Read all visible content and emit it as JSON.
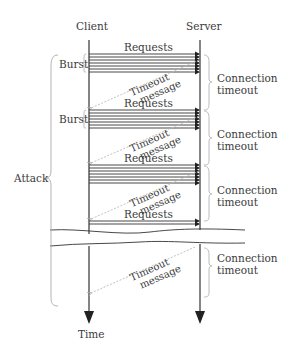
{
  "diagram": {
    "actors": {
      "client": "Client",
      "server": "Server"
    },
    "axis_label": "Time",
    "requests_label": "Requests",
    "burst_label": "Burst",
    "attack_label": "Attack",
    "timeout_message": [
      "Timeout",
      "message"
    ],
    "connection_timeout": [
      "Connection",
      "timeout"
    ],
    "phases": [
      {
        "requests": "Requests",
        "burst": "Burst",
        "timeout": "Connection timeout",
        "message": "Timeout message"
      },
      {
        "requests": "Requests",
        "burst": "Burst",
        "timeout": "Connection timeout",
        "message": "Timeout message"
      },
      {
        "requests": "Requests",
        "timeout": "Connection timeout",
        "message": "Timeout message"
      },
      {
        "requests": "Requests",
        "timeout": "Connection timeout",
        "message": "Timeout message"
      }
    ]
  }
}
